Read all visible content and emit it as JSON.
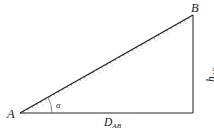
{
  "figure": {
    "type": "right-triangle-slope-diagram",
    "background_color": "#ffffff",
    "stroke_color": "#262626",
    "labels": {
      "vertex_a": "A",
      "vertex_b": "B",
      "angle": "α",
      "horizontal_base": "D",
      "horizontal_base_subscript": "AB",
      "vertical_height": "h",
      "vertical_height_subscript": "AB"
    },
    "geometry": {
      "vertex_a": {
        "x": 20,
        "y": 113
      },
      "vertex_b": {
        "x": 193,
        "y": 15
      },
      "vertex_right_angle": {
        "x": 193,
        "y": 113
      },
      "hypotenuse_hatched": true,
      "angle_arc_radius": 30
    }
  }
}
